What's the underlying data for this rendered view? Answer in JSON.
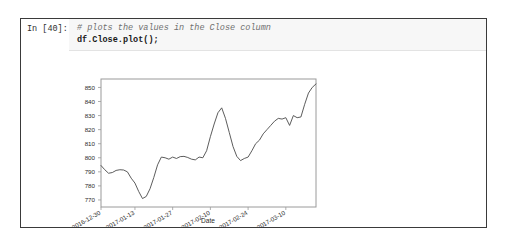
{
  "cell": {
    "prompt": "In [40]:",
    "code_lines": [
      "# plots the values in the Close column",
      "df.Close.plot();"
    ]
  },
  "chart_data": {
    "type": "line",
    "title": "",
    "xlabel": "Date",
    "ylabel": "",
    "grid": false,
    "legend": null,
    "ylim": [
      765,
      856
    ],
    "yticks": [
      770,
      780,
      790,
      800,
      810,
      820,
      830,
      840,
      850
    ],
    "xticks": [
      "2016-12-30",
      "2017-01-13",
      "2017-01-27",
      "2017-02-10",
      "2017-02-24",
      "2017-03-10"
    ],
    "xtick_positions": [
      0,
      9,
      19,
      29,
      39,
      49
    ],
    "line_color": "#4a4a4a",
    "x": [
      0,
      1,
      2,
      3,
      4,
      5,
      6,
      7,
      8,
      9,
      10,
      11,
      12,
      13,
      14,
      15,
      16,
      17,
      18,
      19,
      20,
      21,
      22,
      23,
      24,
      25,
      26,
      27,
      28,
      29,
      30,
      31,
      32,
      33,
      34,
      35,
      36,
      37,
      38,
      39,
      40,
      41,
      42,
      43,
      44,
      45,
      46,
      47,
      48,
      49,
      50,
      51,
      52,
      53,
      54,
      55
    ],
    "values": [
      794.5,
      791.5,
      789.0,
      789.5,
      791.0,
      791.5,
      791.3,
      790.0,
      785.5,
      782.0,
      776.0,
      771.0,
      772.5,
      778.0,
      786.0,
      795.0,
      800.5,
      800.0,
      799.0,
      800.5,
      799.5,
      800.8,
      801.0,
      800.2,
      799.0,
      798.5,
      800.5,
      800.0,
      805.0,
      815.0,
      824.0,
      832.0,
      835.5,
      828.0,
      818.0,
      808.0,
      801.0,
      798.0,
      799.5,
      800.5,
      805.0,
      810.0,
      812.5,
      817.0,
      820.0,
      823.0,
      826.0,
      828.0,
      827.5,
      828.5,
      823.0,
      830.0,
      828.5,
      829.0,
      838.0,
      846.0
    ],
    "series_tail": [
      850.0,
      852.5
    ]
  }
}
